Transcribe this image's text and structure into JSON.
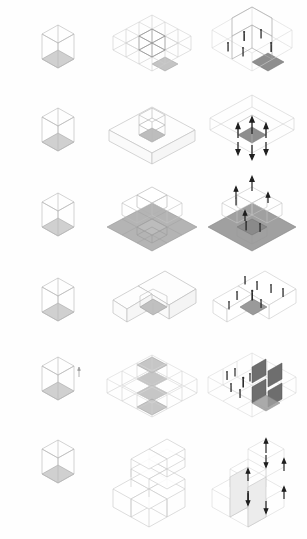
{
  "sheet": {
    "title": "Isometric Massing Studies",
    "background_color": "#fefefe",
    "width": 307,
    "height": 539,
    "columns": 3,
    "rows": 6
  },
  "palette": {
    "line_light": "#c8c8c8",
    "line_mid": "#9a9a9a",
    "line_dark": "#555555",
    "fill_floor_light": "#d5d5d5",
    "fill_floor_mid": "#b9b9b9",
    "fill_floor_dark": "#8e8e8e",
    "fill_wall_dark": "#6e6e6e",
    "figure_color": "#2b2b2b",
    "arrow_color": "#1f1f1f",
    "background": "#fefefe"
  },
  "columns": [
    {
      "id": "unit",
      "label": "Unit Cube"
    },
    {
      "id": "massing",
      "label": "Massing Configuration"
    },
    {
      "id": "inhabited",
      "label": "Inhabited Scheme"
    }
  ],
  "rows": [
    {
      "index": 1,
      "label": "Grid Field",
      "unit": {
        "label": "Base unit cube",
        "floor_shade": "#d0d0d0"
      },
      "massing": {
        "label": "Three by three grid with central raised cube",
        "grid": 3,
        "highlight_cells": 1,
        "floor_shade": "#c4c4c4"
      },
      "inhabited": {
        "label": "Grid frame with figures and shaded court",
        "figures": 5,
        "arrows": 0,
        "floor_shade": "#8e8e8e"
      }
    },
    {
      "index": 2,
      "label": "Courtyard Void",
      "unit": {
        "label": "Base unit cube",
        "floor_shade": "#d0d0d0"
      },
      "massing": {
        "label": "Solid slab with central courtyard void",
        "grid": 3,
        "highlight_cells": 1,
        "floor_shade": "#bdbdbd"
      },
      "inhabited": {
        "label": "Courtyard void with outward arrows",
        "figures": 0,
        "arrows": 6,
        "floor_shade": "#8e8e8e"
      }
    },
    {
      "index": 3,
      "label": "Stepped Terrace",
      "unit": {
        "label": "Base unit cube",
        "floor_shade": "#d0d0d0"
      },
      "massing": {
        "label": "Stepped terraces with raised cube volumes",
        "grid": 3,
        "highlight_cells": 5,
        "floor_shade": "#b4b4b4"
      },
      "inhabited": {
        "label": "Terraces with figures and vertical arrows",
        "figures": 3,
        "arrows": 4,
        "floor_shade": "#a0a0a0"
      }
    },
    {
      "index": 4,
      "label": "L-Shaped Notch",
      "unit": {
        "label": "Base unit cube",
        "floor_shade": "#d0d0d0"
      },
      "massing": {
        "label": "L-shaped bar with corner notch recess",
        "grid": 3,
        "highlight_cells": 2,
        "floor_shade": "#c0c0c0"
      },
      "inhabited": {
        "label": "L-shaped bar with roof figures",
        "figures": 8,
        "arrows": 0,
        "floor_shade": "#9a9a9a"
      }
    },
    {
      "index": 5,
      "label": "Diagonal Band",
      "unit": {
        "label": "Base unit cube",
        "floor_shade": "#d0d0d0"
      },
      "massing": {
        "label": "Grid with diagonal band of shaded cells",
        "grid": 3,
        "highlight_cells": 4,
        "floor_shade": "#bcbcbc"
      },
      "inhabited": {
        "label": "Partition walls with interior figures",
        "figures": 6,
        "arrows": 0,
        "floor_shade": "#8a8a8a"
      }
    },
    {
      "index": 6,
      "label": "Stacked Aggregation",
      "unit": {
        "label": "Base unit cube",
        "floor_shade": "#d0d0d0"
      },
      "massing": {
        "label": "Stacked stepped pyramid of cubes",
        "grid": 3,
        "highlight_cells": 0,
        "floor_shade": "#d8d8d8"
      },
      "inhabited": {
        "label": "Stacked cubes with circulation arrows",
        "figures": 1,
        "arrows": 7,
        "floor_shade": "#c6c6c6"
      }
    }
  ]
}
